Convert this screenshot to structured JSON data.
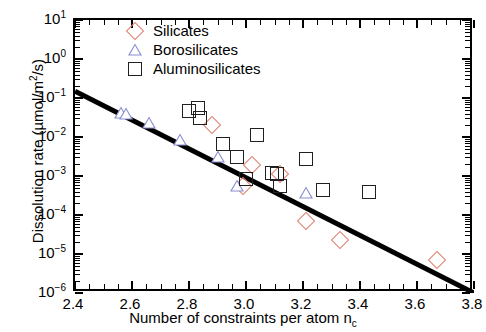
{
  "chart_data": {
    "type": "scatter",
    "title": "",
    "xlabel": "Number of constraints per atom n_c",
    "ylabel": "Dissolution rate (µmol/m²/s)",
    "xlim": [
      2.4,
      3.8
    ],
    "ylim": [
      1e-06,
      10
    ],
    "yscale": "log",
    "xscale": "linear",
    "grid": false,
    "legend_position": "top-center",
    "xticks": [
      "2.4",
      "2.6",
      "2.8",
      "3.0",
      "3.2",
      "3.4",
      "3.6",
      "3.8"
    ],
    "xtick_values": [
      2.4,
      2.6,
      2.8,
      3.0,
      3.2,
      3.4,
      3.6,
      3.8
    ],
    "ytick_exponents": [
      1,
      0,
      -1,
      -2,
      -3,
      -4,
      -5,
      -6
    ],
    "series": [
      {
        "name": "Silicates",
        "marker": "diamond",
        "color": "#e08070",
        "points": [
          {
            "x": 2.88,
            "y": 0.02
          },
          {
            "x": 2.99,
            "y": 0.00055
          },
          {
            "x": 3.02,
            "y": 0.0019
          },
          {
            "x": 3.12,
            "y": 0.0011
          },
          {
            "x": 3.21,
            "y": 7e-05
          },
          {
            "x": 3.33,
            "y": 2.3e-05
          },
          {
            "x": 3.67,
            "y": 7e-06
          }
        ]
      },
      {
        "name": "Borosilicates",
        "marker": "triangle",
        "color": "#8a8fd0",
        "points": [
          {
            "x": 2.56,
            "y": 0.042
          },
          {
            "x": 2.58,
            "y": 0.04
          },
          {
            "x": 2.66,
            "y": 0.023
          },
          {
            "x": 2.77,
            "y": 0.0085
          },
          {
            "x": 2.9,
            "y": 0.003
          },
          {
            "x": 2.97,
            "y": 0.00055
          },
          {
            "x": 3.21,
            "y": 0.00036
          }
        ]
      },
      {
        "name": "Aluminosilicates",
        "marker": "square",
        "color": "#202020",
        "points": [
          {
            "x": 2.8,
            "y": 0.046
          },
          {
            "x": 2.83,
            "y": 0.055
          },
          {
            "x": 2.84,
            "y": 0.03
          },
          {
            "x": 2.92,
            "y": 0.0065
          },
          {
            "x": 2.97,
            "y": 0.003
          },
          {
            "x": 3.0,
            "y": 0.00083
          },
          {
            "x": 3.04,
            "y": 0.011
          },
          {
            "x": 3.09,
            "y": 0.0012
          },
          {
            "x": 3.11,
            "y": 0.0011
          },
          {
            "x": 3.12,
            "y": 0.00055
          },
          {
            "x": 3.21,
            "y": 0.0028
          },
          {
            "x": 3.27,
            "y": 0.00045
          },
          {
            "x": 3.43,
            "y": 0.0004
          }
        ]
      }
    ],
    "trend_line": {
      "name": "fit",
      "color": "#000000",
      "x_start": 2.4,
      "y_start": 0.15,
      "x_end": 3.8,
      "y_end": 6e-07
    }
  },
  "legend": {
    "items": [
      {
        "label": "Silicates",
        "marker": "diamond-icon"
      },
      {
        "label": "Borosilicates",
        "marker": "triangle-icon"
      },
      {
        "label": "Aluminosilicates",
        "marker": "square-icon"
      }
    ]
  },
  "axes": {
    "x_title_main": "Number of constraints per atom n",
    "x_title_sub": "c",
    "y_title_pre": "Dissolution rate (µmol/m",
    "y_title_sup": "2",
    "y_title_post": "/s)"
  }
}
